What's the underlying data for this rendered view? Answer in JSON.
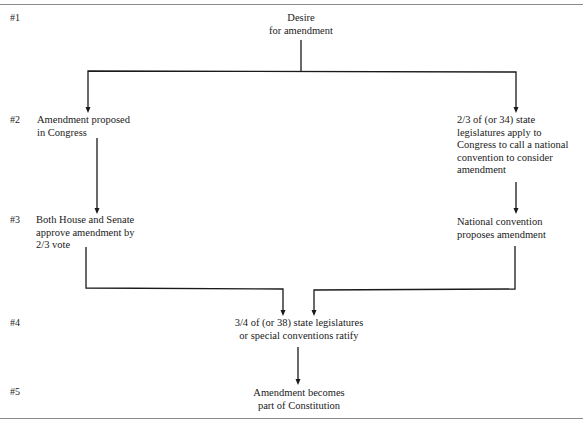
{
  "diagram": {
    "steps": [
      "#1",
      "#2",
      "#3",
      "#4",
      "#5"
    ],
    "nodes": {
      "desire": [
        "Desire",
        "for amendment"
      ],
      "congress_proposal": [
        "Amendment proposed",
        "in Congress"
      ],
      "state_application": [
        "2/3 of (or 34) state",
        "legislatures apply to",
        "Congress to call a national",
        "convention to consider",
        "amendment"
      ],
      "congress_approval": [
        "Both House and Senate",
        "approve amendment by",
        "2/3 vote"
      ],
      "convention_proposal": [
        "National convention",
        "proposes amendment"
      ],
      "ratification": [
        "3/4 of (or 38) state legislatures",
        "or special conventions ratify"
      ],
      "result": [
        "Amendment becomes",
        "part of Constitution"
      ]
    },
    "edges": [
      {
        "from": "desire",
        "to": "congress_proposal"
      },
      {
        "from": "desire",
        "to": "state_application"
      },
      {
        "from": "congress_proposal",
        "to": "congress_approval"
      },
      {
        "from": "state_application",
        "to": "convention_proposal"
      },
      {
        "from": "congress_approval",
        "to": "ratification"
      },
      {
        "from": "convention_proposal",
        "to": "ratification"
      },
      {
        "from": "ratification",
        "to": "result"
      }
    ],
    "line_color": "#1a1a1a",
    "rule_color": "#8a8a8a"
  }
}
